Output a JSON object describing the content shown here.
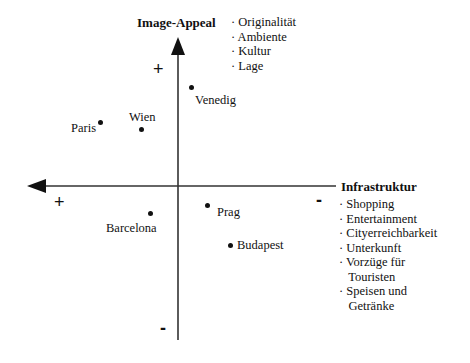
{
  "diagram": {
    "y_axis": {
      "title": "Image-Appeal",
      "factors": [
        "· Originalität",
        "· Ambiente",
        "· Kultur",
        "· Lage"
      ],
      "positive_sign": "+",
      "negative_sign": "-"
    },
    "x_axis": {
      "title": "Infrastruktur",
      "factors": [
        "· Shopping",
        "· Entertainment",
        "· Cityerreichbarkeit",
        "· Unterkunft",
        "· Vorzüge für",
        "   Touristen",
        "· Speisen und",
        "   Getränke"
      ],
      "positive_sign": "+",
      "negative_sign": "-"
    },
    "cities": [
      {
        "name": "Venedig",
        "x": 191,
        "y": 87
      },
      {
        "name": "Paris",
        "x": 100,
        "y": 123
      },
      {
        "name": "Wien",
        "x": 141,
        "y": 129
      },
      {
        "name": "Barcelona",
        "x": 150,
        "y": 213
      },
      {
        "name": "Prag",
        "x": 207,
        "y": 205
      },
      {
        "name": "Budapest",
        "x": 230,
        "y": 245
      }
    ]
  }
}
